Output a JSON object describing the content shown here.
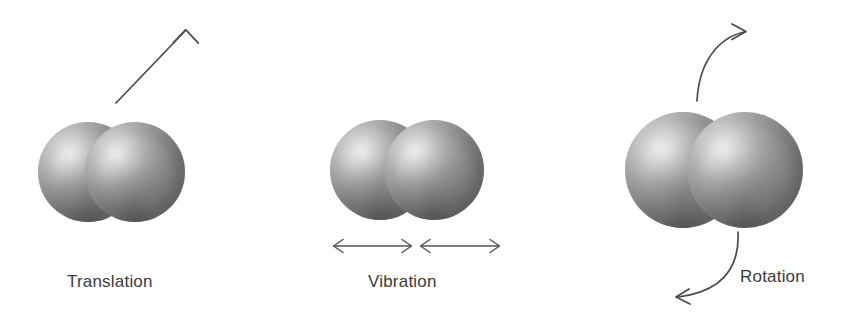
{
  "figure": {
    "background_color": "#ffffff",
    "ink_color": "#4a4a4a",
    "text_color": "#3b3b3b"
  },
  "panels": [
    {
      "key": "translation",
      "label": "Translation",
      "motion_indicator": "straight-arrow-up-right",
      "molecule": {
        "atoms": 2,
        "description": "diatomic molecule, two shaded gray spheres"
      }
    },
    {
      "key": "vibration",
      "label": "Vibration",
      "motion_indicator": "two-double-headed-horizontal-arrows",
      "molecule": {
        "atoms": 2,
        "description": "diatomic molecule, two shaded gray spheres"
      }
    },
    {
      "key": "rotation",
      "label": "Rotation",
      "motion_indicator": "two-curved-arrows-opposing",
      "molecule": {
        "atoms": 2,
        "description": "diatomic molecule, two shaded gray spheres"
      }
    }
  ]
}
